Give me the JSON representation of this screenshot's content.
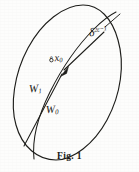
{
  "figure": {
    "caption": "Fig. 1",
    "background_color": "#fdfdfc",
    "ink_color": "#1a1a17",
    "stroke_width": 1.1
  },
  "labels": {
    "point_marker": "∘",
    "point_base": "x",
    "point_sub": "0",
    "region_outer_base": "W",
    "region_outer_sub": "1",
    "region_inner_base": "W",
    "region_inner_sub": "0",
    "delta_base": "δ",
    "delta_sup": "2ε−1"
  },
  "geometry": {
    "ellipse_note": "tilted ellipse, major axis from lower-left to upper-right",
    "ellipse_center_x": 69,
    "ellipse_center_y": 74,
    "ellipse_rx": 26,
    "ellipse_ry": 70,
    "ellipse_rotation_deg": 28,
    "inner_curve_note": "second arc splitting the ellipse into W1 and W0",
    "arrow_note": "arrowhead on the chord pointing down-left toward x0",
    "arrow_tip_x": 62,
    "arrow_tip_y": 74,
    "leader_note": "leader line from delta label up-right to ellipse boundary"
  }
}
